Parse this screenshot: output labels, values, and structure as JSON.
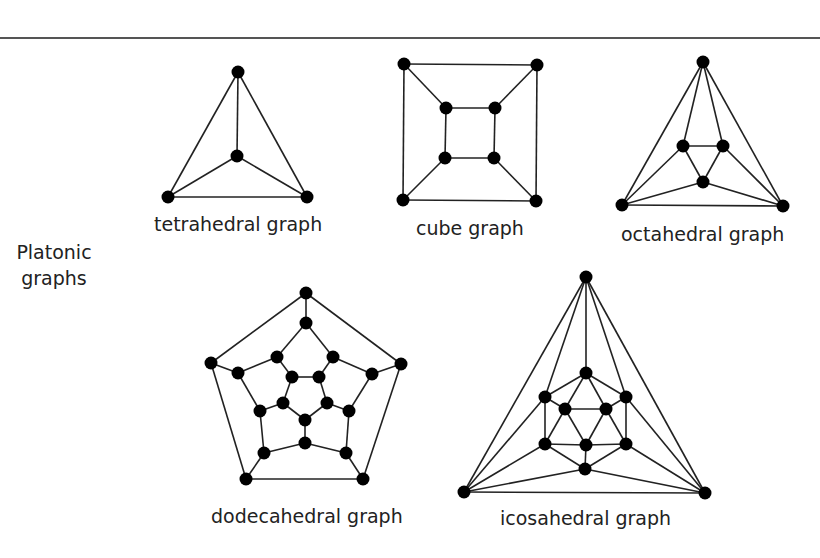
{
  "section_label": {
    "line1": "Platonic",
    "line2": "graphs"
  },
  "colors": {
    "edge": "#222222",
    "node": "#000000",
    "rule": "#555555",
    "text": "#222222"
  },
  "graphs": [
    {
      "name": "tetrahedral graph",
      "nodes": [
        [
          238,
          72
        ],
        [
          237,
          156
        ],
        [
          168,
          197
        ],
        [
          307,
          197
        ]
      ],
      "edges": [
        [
          0,
          1
        ],
        [
          0,
          2
        ],
        [
          0,
          3
        ],
        [
          1,
          2
        ],
        [
          1,
          3
        ],
        [
          2,
          3
        ]
      ]
    },
    {
      "name": "cube graph",
      "nodes": [
        [
          404,
          64
        ],
        [
          537,
          65
        ],
        [
          536,
          201
        ],
        [
          403,
          200
        ],
        [
          446,
          108
        ],
        [
          495,
          108
        ],
        [
          494,
          158
        ],
        [
          445,
          158
        ]
      ],
      "edges": [
        [
          0,
          1
        ],
        [
          1,
          2
        ],
        [
          2,
          3
        ],
        [
          3,
          0
        ],
        [
          4,
          5
        ],
        [
          5,
          6
        ],
        [
          6,
          7
        ],
        [
          7,
          4
        ],
        [
          0,
          4
        ],
        [
          1,
          5
        ],
        [
          2,
          6
        ],
        [
          3,
          7
        ]
      ]
    },
    {
      "name": "octahedral graph",
      "nodes": [
        [
          703,
          62
        ],
        [
          622,
          205
        ],
        [
          783,
          206
        ],
        [
          683,
          146
        ],
        [
          723,
          146
        ],
        [
          703,
          182
        ]
      ],
      "edges": [
        [
          0,
          1
        ],
        [
          0,
          2
        ],
        [
          1,
          2
        ],
        [
          0,
          3
        ],
        [
          0,
          4
        ],
        [
          3,
          4
        ],
        [
          3,
          5
        ],
        [
          4,
          5
        ],
        [
          1,
          3
        ],
        [
          1,
          5
        ],
        [
          2,
          4
        ],
        [
          2,
          5
        ]
      ]
    },
    {
      "name": "dodecahedral graph",
      "nodes": [
        [
          306,
          293
        ],
        [
          401,
          364
        ],
        [
          363,
          479
        ],
        [
          246,
          479
        ],
        [
          211,
          363
        ],
        [
          306,
          323
        ],
        [
          333,
          357
        ],
        [
          372,
          374
        ],
        [
          349,
          411
        ],
        [
          346,
          453
        ],
        [
          305,
          443
        ],
        [
          264,
          453
        ],
        [
          260,
          411
        ],
        [
          238,
          373
        ],
        [
          277,
          357
        ],
        [
          292,
          377
        ],
        [
          319,
          377
        ],
        [
          327,
          403
        ],
        [
          305,
          420
        ],
        [
          283,
          403
        ]
      ],
      "edges": [
        [
          0,
          1
        ],
        [
          1,
          2
        ],
        [
          2,
          3
        ],
        [
          3,
          4
        ],
        [
          4,
          0
        ],
        [
          0,
          5
        ],
        [
          1,
          7
        ],
        [
          2,
          9
        ],
        [
          3,
          11
        ],
        [
          4,
          13
        ],
        [
          5,
          6
        ],
        [
          6,
          7
        ],
        [
          7,
          8
        ],
        [
          8,
          9
        ],
        [
          9,
          10
        ],
        [
          10,
          11
        ],
        [
          11,
          12
        ],
        [
          12,
          13
        ],
        [
          13,
          14
        ],
        [
          14,
          5
        ],
        [
          14,
          15
        ],
        [
          6,
          16
        ],
        [
          8,
          17
        ],
        [
          10,
          18
        ],
        [
          12,
          19
        ],
        [
          15,
          16
        ],
        [
          16,
          17
        ],
        [
          17,
          18
        ],
        [
          18,
          19
        ],
        [
          19,
          15
        ]
      ]
    },
    {
      "name": "icosahedral graph",
      "nodes": [
        [
          586,
          277
        ],
        [
          464,
          492
        ],
        [
          705,
          493
        ],
        [
          586,
          373
        ],
        [
          545,
          397
        ],
        [
          626,
          397
        ],
        [
          565,
          409
        ],
        [
          606,
          409
        ],
        [
          545,
          444
        ],
        [
          586,
          445
        ],
        [
          626,
          444
        ],
        [
          585,
          469
        ]
      ],
      "edges": [
        [
          0,
          1
        ],
        [
          0,
          2
        ],
        [
          1,
          2
        ],
        [
          0,
          3
        ],
        [
          0,
          4
        ],
        [
          0,
          5
        ],
        [
          1,
          4
        ],
        [
          1,
          8
        ],
        [
          1,
          11
        ],
        [
          2,
          5
        ],
        [
          2,
          10
        ],
        [
          2,
          11
        ],
        [
          3,
          4
        ],
        [
          3,
          5
        ],
        [
          3,
          6
        ],
        [
          3,
          7
        ],
        [
          4,
          6
        ],
        [
          4,
          8
        ],
        [
          5,
          7
        ],
        [
          5,
          10
        ],
        [
          6,
          7
        ],
        [
          6,
          8
        ],
        [
          6,
          9
        ],
        [
          7,
          10
        ],
        [
          7,
          9
        ],
        [
          8,
          9
        ],
        [
          9,
          10
        ],
        [
          8,
          11
        ],
        [
          10,
          11
        ],
        [
          9,
          11
        ]
      ]
    }
  ],
  "labels": [
    {
      "text": "tetrahedral graph",
      "x": 154,
      "y": 213
    },
    {
      "text": "cube graph",
      "x": 416,
      "y": 217
    },
    {
      "text": "octahedral graph",
      "x": 621,
      "y": 223
    },
    {
      "text": "dodecahedral graph",
      "x": 211,
      "y": 505
    },
    {
      "text": "icosahedral graph",
      "x": 500,
      "y": 507
    }
  ]
}
